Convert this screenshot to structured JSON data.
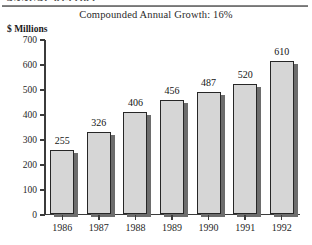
{
  "document": {
    "cropped_header_fragment": "ANNUAL REPORT"
  },
  "chart_data": {
    "type": "bar",
    "title": "Compounded Annual Growth: 16%",
    "xlabel": "",
    "ylabel": "$ Millions",
    "categories": [
      "1986",
      "1987",
      "1988",
      "1989",
      "1990",
      "1991",
      "1992"
    ],
    "values": [
      255,
      326,
      406,
      456,
      487,
      520,
      610
    ],
    "value_labels": [
      "255",
      "326",
      "406",
      "456",
      "487",
      "520",
      "610"
    ],
    "ylim": [
      0,
      700
    ],
    "ytick_labels": [
      "0",
      "100",
      "200",
      "300",
      "400",
      "500",
      "600",
      "700"
    ],
    "ytick_values": [
      0,
      100,
      200,
      300,
      400,
      500,
      600,
      700
    ],
    "grid": false,
    "legend": null,
    "colors": {
      "bar_fill": "#d6d6d6",
      "bar_border": "#272727",
      "bar_shadow": "#6d6d6d",
      "axis": "#3b3b3b",
      "text": "#1f1f1f",
      "rule": "#7d7d7d"
    }
  }
}
